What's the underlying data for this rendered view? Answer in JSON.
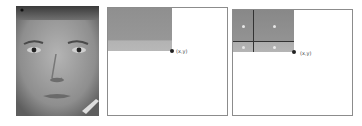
{
  "panels": [
    {
      "id": "face-image",
      "description": "grayscale face photograph"
    },
    {
      "id": "integral-region",
      "point_label": "(x,y)"
    },
    {
      "id": "subdivided-region",
      "point_label": "(x,y)",
      "cells": 4
    }
  ],
  "colors": {
    "region_dark": "#8f8f8f",
    "region_light": "#b0b0b0",
    "border": "#8c8c8c",
    "grid_line": "#333333"
  }
}
